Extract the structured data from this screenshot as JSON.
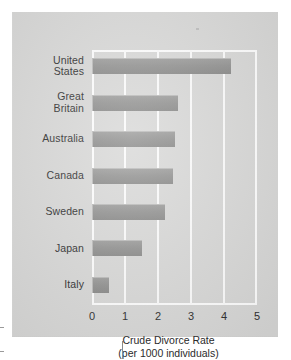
{
  "figure": {
    "name": "crude-divorce-rate-by-country",
    "background_color": "#d7d7d6",
    "bar_color": "#8f8f8e",
    "bar_shadow_color": "#6e6e6d",
    "grid_color": "#fdfdfd",
    "text_color": "#2b2b2b"
  },
  "chart_data": {
    "type": "bar",
    "orientation": "horizontal",
    "title": "",
    "xlabel": "Crude Divorce Rate",
    "xlabel_line2": "(per 1000 individuals)",
    "ylabel": "",
    "xlim": [
      0,
      5
    ],
    "xticks": [
      "0",
      "1",
      "2",
      "3",
      "4",
      "5"
    ],
    "xtick_values": [
      0,
      1,
      2,
      3,
      4,
      5
    ],
    "grid": true,
    "grid_axis": "x",
    "legend": false,
    "categories": [
      "United States",
      "Great Britain",
      "Australia",
      "Canada",
      "Sweden",
      "Japan",
      "Italy"
    ],
    "category_lines": [
      [
        "United",
        "States"
      ],
      [
        "Great",
        "Britain"
      ],
      [
        "Australia"
      ],
      [
        "Canada"
      ],
      [
        "Sweden"
      ],
      [
        "Japan"
      ],
      [
        "Italy"
      ]
    ],
    "values": [
      4.2,
      2.6,
      2.5,
      2.45,
      2.2,
      1.5,
      0.5
    ]
  }
}
